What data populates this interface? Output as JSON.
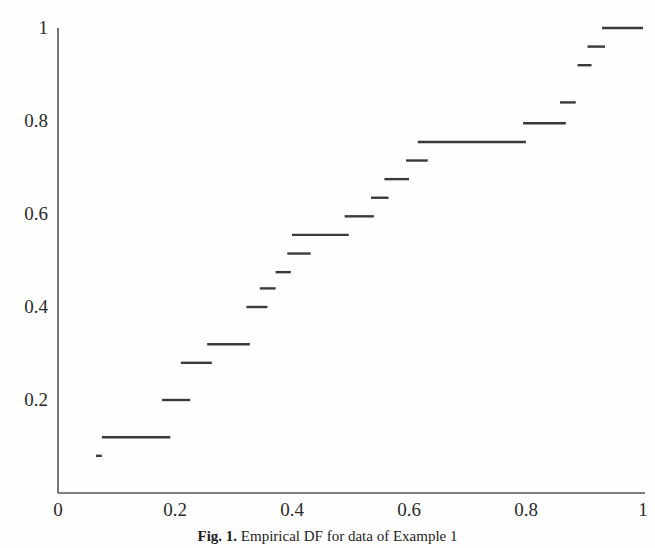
{
  "figure": {
    "caption_label": "Fig. 1.",
    "caption_text": "Empirical DF for data of Example 1",
    "background_color": "#fefefe",
    "line_color": "#3a3a3a",
    "axis_color": "#555555"
  },
  "chart_data": {
    "type": "line",
    "title": "",
    "subtitle": "",
    "xlabel": "",
    "ylabel": "",
    "xlim": [
      0,
      1
    ],
    "ylim": [
      0,
      1
    ],
    "grid": false,
    "legend": false,
    "legend_position": "none",
    "style": "step-post",
    "xticks": [
      0,
      0.2,
      0.4,
      0.6,
      0.8,
      1
    ],
    "xtick_labels": [
      "0",
      "0.2",
      "0.4",
      "0.6",
      "0.8",
      "1"
    ],
    "yticks": [
      0,
      0.2,
      0.4,
      0.6,
      0.8,
      1
    ],
    "ytick_labels": [
      "0",
      "0.2",
      "0.4",
      "0.6",
      "0.8",
      "1"
    ],
    "n": 25,
    "x": [
      0.065,
      0.075,
      0.19,
      0.215,
      0.255,
      0.33,
      0.345,
      0.375,
      0.395,
      0.43,
      0.5,
      0.525,
      0.545,
      0.565,
      0.6,
      0.625,
      0.8,
      0.825,
      0.85,
      0.875,
      0.9,
      0.915,
      0.93
    ],
    "y": [
      0.08,
      0.12,
      0.2,
      0.28,
      0.32,
      0.4,
      0.44,
      0.475,
      0.515,
      0.555,
      0.595,
      0.6,
      0.635,
      0.675,
      0.715,
      0.755,
      0.795,
      0.84,
      0.875,
      0.92,
      0.96,
      1.0,
      1.0
    ],
    "steps": [
      {
        "x_start": 0.065,
        "x_end": 0.075,
        "y": 0.08
      },
      {
        "x_start": 0.075,
        "x_end": 0.192,
        "y": 0.12
      },
      {
        "x_start": 0.178,
        "x_end": 0.226,
        "y": 0.2
      },
      {
        "x_start": 0.21,
        "x_end": 0.263,
        "y": 0.28
      },
      {
        "x_start": 0.255,
        "x_end": 0.328,
        "y": 0.32
      },
      {
        "x_start": 0.322,
        "x_end": 0.358,
        "y": 0.4
      },
      {
        "x_start": 0.345,
        "x_end": 0.372,
        "y": 0.44
      },
      {
        "x_start": 0.372,
        "x_end": 0.398,
        "y": 0.475
      },
      {
        "x_start": 0.392,
        "x_end": 0.432,
        "y": 0.515
      },
      {
        "x_start": 0.4,
        "x_end": 0.497,
        "y": 0.555
      },
      {
        "x_start": 0.49,
        "x_end": 0.54,
        "y": 0.595
      },
      {
        "x_start": 0.535,
        "x_end": 0.565,
        "y": 0.635
      },
      {
        "x_start": 0.558,
        "x_end": 0.6,
        "y": 0.675
      },
      {
        "x_start": 0.595,
        "x_end": 0.632,
        "y": 0.715
      },
      {
        "x_start": 0.615,
        "x_end": 0.8,
        "y": 0.755
      },
      {
        "x_start": 0.795,
        "x_end": 0.868,
        "y": 0.795
      },
      {
        "x_start": 0.858,
        "x_end": 0.885,
        "y": 0.84
      },
      {
        "x_start": 0.888,
        "x_end": 0.912,
        "y": 0.92
      },
      {
        "x_start": 0.905,
        "x_end": 0.935,
        "y": 0.96
      },
      {
        "x_start": 0.93,
        "x_end": 1.0,
        "y": 1.0
      }
    ]
  }
}
